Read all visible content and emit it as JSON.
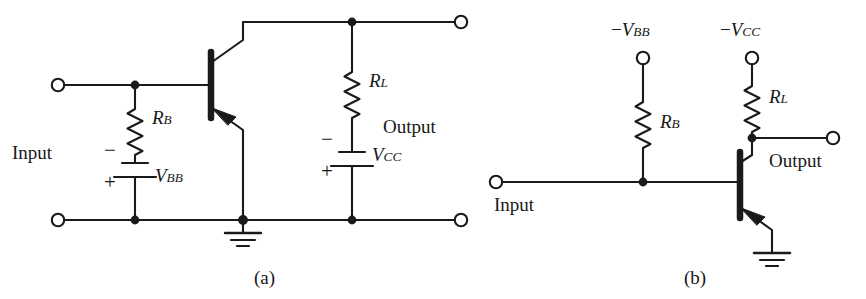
{
  "figure": {
    "kind": "circuit-schematic",
    "line_color": "#1a1a1a",
    "background": "#ffffff",
    "captions": [
      {
        "id": "caption-a",
        "text": "(a)"
      },
      {
        "id": "caption-b",
        "text": "(b)"
      }
    ]
  },
  "circuit_a": {
    "input_label": "Input",
    "output_label": "Output",
    "resistor_base": {
      "symbol": "R",
      "subscript": "B"
    },
    "resistor_load": {
      "symbol": "R",
      "subscript": "L"
    },
    "battery_base": {
      "symbol": "V",
      "subscript": "BB",
      "top_terminal_sign": "−",
      "bottom_terminal_sign": "+"
    },
    "battery_collector": {
      "symbol": "V",
      "subscript": "CC",
      "top_terminal_sign": "−",
      "bottom_terminal_sign": "+"
    },
    "transistor": {
      "type": "PNP",
      "name": "Q1"
    },
    "ground": "earth-ground",
    "terminals": [
      "input-top",
      "input-bottom",
      "output-top",
      "output-bottom"
    ]
  },
  "circuit_b": {
    "input_label": "Input",
    "output_label": "Output",
    "supply_base": {
      "sign": "−",
      "symbol": "V",
      "subscript": "BB"
    },
    "supply_collector": {
      "sign": "−",
      "symbol": "V",
      "subscript": "CC"
    },
    "resistor_base": {
      "symbol": "R",
      "subscript": "B"
    },
    "resistor_load": {
      "symbol": "R",
      "subscript": "L"
    },
    "transistor": {
      "type": "PNP",
      "name": "Q1"
    },
    "ground": "earth-ground",
    "terminals": [
      "supply-bb",
      "supply-cc",
      "input",
      "output"
    ]
  }
}
